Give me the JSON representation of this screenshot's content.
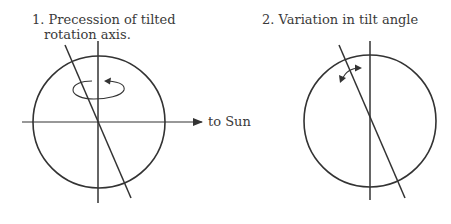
{
  "panels": [
    {
      "id": 1,
      "title_line1": "1. Precession of tilted",
      "title_line2": "rotation axis.",
      "direction_label": "to Sun",
      "elements": [
        "circle",
        "vertical-axis",
        "tilted-axis",
        "horizontal-sun-line",
        "rotation-ellipse-arrow"
      ]
    },
    {
      "id": 2,
      "title_line1": "2. Variation in tilt angle",
      "elements": [
        "circle",
        "vertical-axis",
        "tilted-axis",
        "double-curved-arrow"
      ]
    }
  ],
  "colors": {
    "line": "#333333",
    "text": "#3a3a3a",
    "background": "#ffffff"
  }
}
